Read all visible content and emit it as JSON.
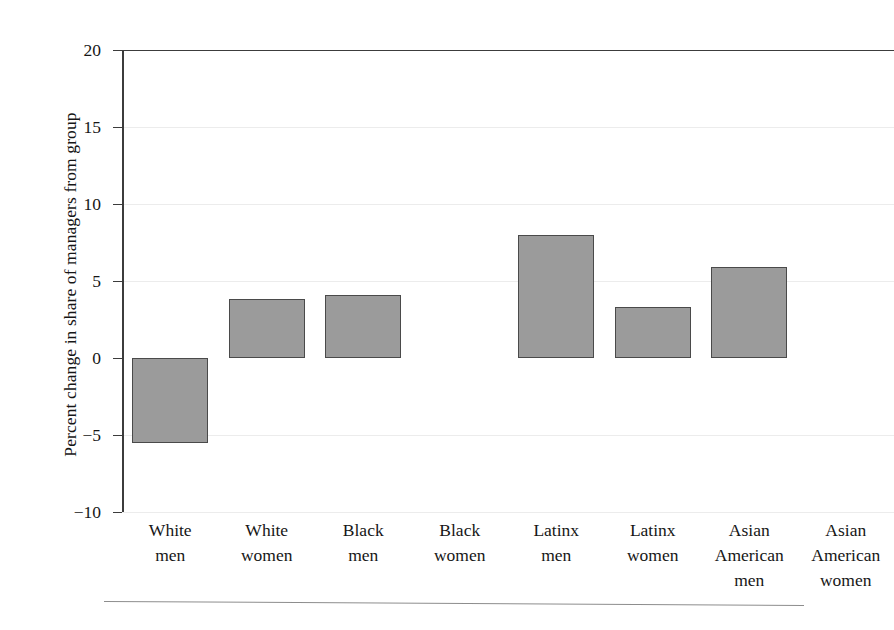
{
  "chart_data": {
    "type": "bar",
    "title": "",
    "subtitle": "",
    "xlabel": "",
    "ylabel": "Percent change in share of managers from group",
    "categories": [
      "White men",
      "White women",
      "Black men",
      "Black women",
      "Latinx men",
      "Latinx women",
      "Asian American men",
      "Asian American women"
    ],
    "category_lines": [
      [
        "White",
        "men"
      ],
      [
        "White",
        "women"
      ],
      [
        "Black",
        "men"
      ],
      [
        "Black",
        "women"
      ],
      [
        "Latinx",
        "men"
      ],
      [
        "Latinx",
        "women"
      ],
      [
        "Asian",
        "American",
        "men"
      ],
      [
        "Asian",
        "American",
        "women"
      ]
    ],
    "values": [
      -5.5,
      3.8,
      4.1,
      0,
      8.0,
      3.3,
      5.9,
      0
    ],
    "ylim": [
      -10,
      20
    ],
    "yticks": [
      20,
      15,
      10,
      5,
      0,
      -5,
      -10
    ],
    "ytick_labels": [
      "20",
      "15",
      "10",
      "5",
      "0",
      "−5",
      "−10"
    ],
    "grid": true,
    "grid_axis": "y",
    "legend": false,
    "legend_position": "none",
    "bar_fill_color": "#9b9b9b",
    "bar_edge_color": "#4a4a4a",
    "gridline_color": "#ececec",
    "axis_color": "#3c3c3c",
    "zero_reference_line": 0
  }
}
